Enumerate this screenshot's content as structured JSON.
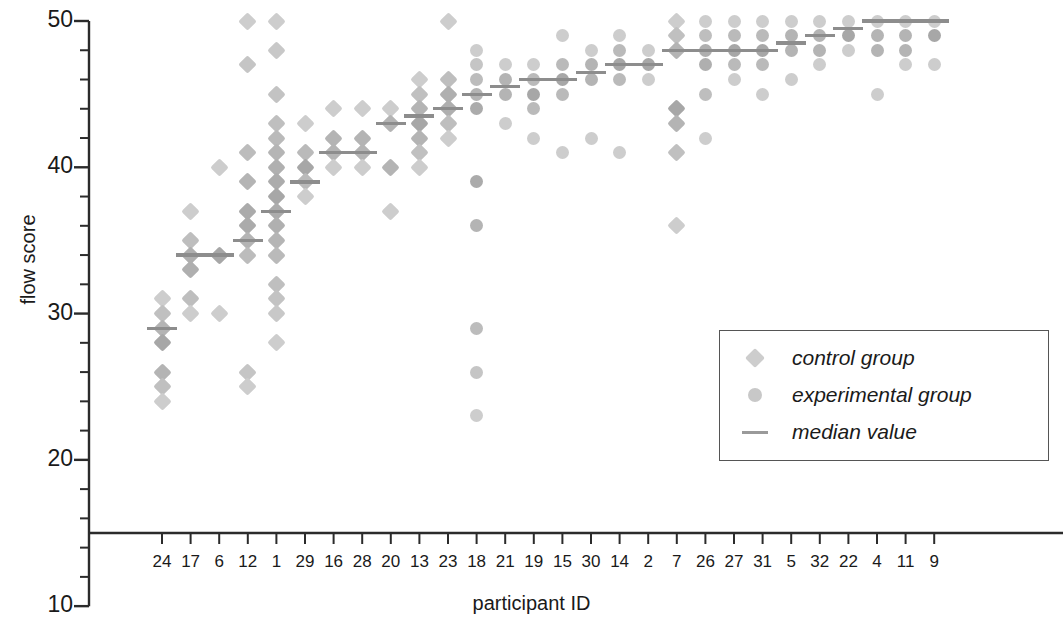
{
  "chart_data": {
    "type": "scatter",
    "title": "",
    "xlabel": "participant ID",
    "ylabel": "flow score",
    "ylim": [
      10,
      50
    ],
    "yticks": [
      10,
      20,
      30,
      40,
      50
    ],
    "y_minor_step": 2,
    "y_axis_baseline": 15,
    "grid": false,
    "legend_position": "right-middle",
    "legend": [
      {
        "label": "control group",
        "marker": "diamond",
        "color": "#c9c9c9"
      },
      {
        "label": "experimental group",
        "marker": "circle",
        "color": "#bfbfbf"
      },
      {
        "label": "median value",
        "marker": "line",
        "color": "#8a8a8a"
      }
    ],
    "categories": [
      "24",
      "17",
      "6",
      "12",
      "1",
      "29",
      "16",
      "28",
      "20",
      "13",
      "23",
      "18",
      "21",
      "19",
      "15",
      "30",
      "14",
      "2",
      "7",
      "26",
      "27",
      "31",
      "5",
      "32",
      "22",
      "4",
      "11",
      "9"
    ],
    "series": [
      {
        "name": "control group",
        "marker": "diamond",
        "participants": [
          {
            "id": "24",
            "values": [
              31,
              30,
              29,
              28,
              26,
              25,
              24
            ],
            "median": 29
          },
          {
            "id": "17",
            "values": [
              37,
              35,
              34,
              33,
              31,
              30
            ],
            "median": 34
          },
          {
            "id": "6",
            "values": [
              40,
              34,
              30
            ],
            "median": 34
          },
          {
            "id": "12",
            "values": [
              50,
              47,
              41,
              39,
              37,
              36,
              35,
              34,
              26,
              25
            ],
            "median": 35
          },
          {
            "id": "1",
            "values": [
              50,
              48,
              45,
              43,
              42,
              41,
              40,
              39,
              38,
              37,
              36,
              35,
              34,
              32,
              31,
              30,
              28
            ],
            "median": 37
          },
          {
            "id": "29",
            "values": [
              43,
              41,
              40,
              39,
              38
            ],
            "median": 39
          },
          {
            "id": "16",
            "values": [
              44,
              42,
              41,
              40
            ],
            "median": 41
          },
          {
            "id": "28",
            "values": [
              44,
              42,
              41,
              40
            ],
            "median": 41
          },
          {
            "id": "20",
            "values": [
              44,
              43,
              40,
              37
            ],
            "median": 43
          },
          {
            "id": "13",
            "values": [
              46,
              45,
              44,
              43,
              42,
              41,
              40
            ],
            "median": 43.5
          },
          {
            "id": "23",
            "values": [
              50,
              46,
              45,
              44,
              43,
              42
            ],
            "median": 44
          },
          {
            "id": "7",
            "values": [
              50,
              49,
              48,
              44,
              43,
              41,
              36
            ],
            "median": 48
          }
        ]
      },
      {
        "name": "experimental group",
        "marker": "circle",
        "participants": [
          {
            "id": "18",
            "values": [
              48,
              47,
              46,
              45,
              44,
              39,
              36,
              29,
              26,
              23
            ],
            "median": 45
          },
          {
            "id": "21",
            "values": [
              47,
              46,
              45,
              43
            ],
            "median": 45.5
          },
          {
            "id": "19",
            "values": [
              47,
              46,
              45,
              44,
              42
            ],
            "median": 46
          },
          {
            "id": "15",
            "values": [
              49,
              47,
              46,
              45,
              41
            ],
            "median": 46
          },
          {
            "id": "30",
            "values": [
              48,
              47,
              46,
              42
            ],
            "median": 46.5
          },
          {
            "id": "14",
            "values": [
              49,
              48,
              47,
              46,
              41
            ],
            "median": 47
          },
          {
            "id": "2",
            "values": [
              48,
              47,
              46
            ],
            "median": 47
          },
          {
            "id": "26",
            "values": [
              50,
              49,
              48,
              47,
              45,
              42
            ],
            "median": 48
          },
          {
            "id": "27",
            "values": [
              50,
              49,
              48,
              47,
              46
            ],
            "median": 48
          },
          {
            "id": "31",
            "values": [
              50,
              49,
              48,
              47,
              45
            ],
            "median": 48
          },
          {
            "id": "5",
            "values": [
              50,
              49,
              48,
              46
            ],
            "median": 48.5
          },
          {
            "id": "32",
            "values": [
              50,
              49,
              48,
              47
            ],
            "median": 49
          },
          {
            "id": "22",
            "values": [
              50,
              49,
              48
            ],
            "median": 49.5
          },
          {
            "id": "4",
            "values": [
              50,
              49,
              48,
              45
            ],
            "median": 50
          },
          {
            "id": "11",
            "values": [
              50,
              49,
              48,
              47
            ],
            "median": 50
          },
          {
            "id": "9",
            "values": [
              50,
              49,
              47
            ],
            "median": 50
          }
        ]
      }
    ]
  },
  "axis": {
    "y_label": "flow score",
    "x_label": "participant ID",
    "y_tick_labels": [
      "50",
      "40",
      "30",
      "20",
      "10"
    ],
    "x_tick_labels": [
      "24",
      "17",
      "6",
      "12",
      "1",
      "29",
      "16",
      "28",
      "20",
      "13",
      "23",
      "18",
      "21",
      "19",
      "15",
      "30",
      "14",
      "2",
      "7",
      "26",
      "27",
      "31",
      "5",
      "32",
      "22",
      "4",
      "11",
      "9"
    ]
  },
  "legend": {
    "items": [
      {
        "label": "control group"
      },
      {
        "label": "experimental group"
      },
      {
        "label": "median value"
      }
    ]
  },
  "colors": {
    "control_marker": "#c7c7c7",
    "experimental_marker": "#c2c2c2",
    "median_line": "#8d8d8d",
    "axis": "#2b2b2b",
    "text": "#1a1a1a"
  }
}
